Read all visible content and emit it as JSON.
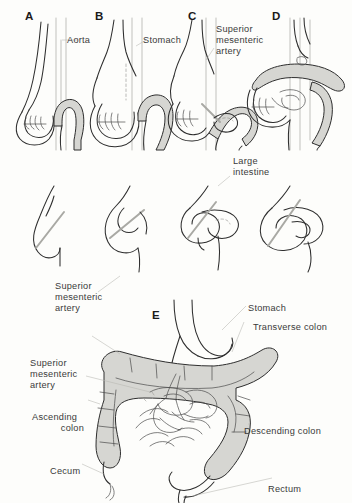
{
  "figure": {
    "background_color": "#fdfdfb",
    "ink_color": "#2e2e2e",
    "gut_shading_color": "#d6d6d2",
    "artery_color": "#a9a9a4"
  },
  "panels": [
    {
      "letter": "A"
    },
    {
      "letter": "B"
    },
    {
      "letter": "C"
    },
    {
      "letter": "D"
    },
    {
      "letter": "E"
    }
  ],
  "labels": {
    "aorta": "Aorta",
    "stomach_top": "Stomach",
    "sma_top_line1": "Superior",
    "sma_top_line2": "mesenteric",
    "sma_top_line3": "artery",
    "large_intestine_line1": "Large",
    "large_intestine_line2": "intestine",
    "sma_mid_line1": "Superior",
    "sma_mid_line2": "mesenteric",
    "sma_mid_line3": "artery",
    "sma_low_line1": "Superior",
    "sma_low_line2": "mesenteric",
    "sma_low_line3": "artery",
    "ascending_colon_line1": "Ascending",
    "ascending_colon_line2": "colon",
    "cecum": "Cecum",
    "stomach_bottom": "Stomach",
    "transverse_colon": "Transverse colon",
    "descending_colon": "Descending colon",
    "rectum": "Rectum"
  }
}
